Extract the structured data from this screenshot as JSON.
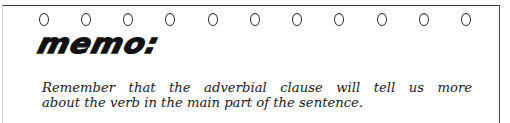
{
  "memo": {
    "rings": {
      "count": 11,
      "glyph": "0",
      "x_positions": [
        44,
        86,
        128,
        170,
        213,
        255,
        297,
        339,
        382,
        424,
        466
      ]
    },
    "title": "memo:",
    "body": {
      "line1": "Remember that the adverbial clause will tell us more",
      "line2": "about the verb in the main part of the sentence."
    }
  },
  "colors": {
    "background": "#ffffff",
    "border": "#3a3a3a",
    "text": "#1a1a1a"
  }
}
